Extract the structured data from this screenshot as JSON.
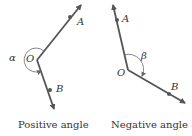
{
  "diagrams": [
    {
      "caption": "Positive angle",
      "vertex_label": "O",
      "angle_label": "α",
      "point_a_label": "A",
      "point_b_label": "B"
    },
    {
      "caption": "Negative angle",
      "vertex_label": "O",
      "angle_label": "β",
      "point_a_label": "A",
      "point_b_label": "B"
    }
  ],
  "colors": {
    "ray": "#555555",
    "arc": "#666666",
    "text": "#333333"
  }
}
